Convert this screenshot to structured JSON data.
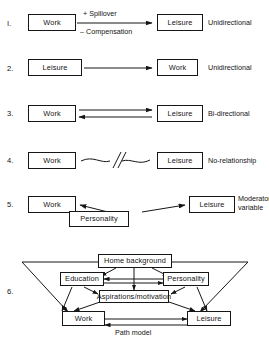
{
  "figure": {
    "background_color": "#ffffff",
    "line_color": "#161616"
  },
  "rows": [
    {
      "number": "I.",
      "left_box": "Work",
      "right_box": "Leisure",
      "label_above_arrow": "+ Spillover",
      "label_below_arrow": "– Compensation",
      "relationship": "Unidirectional",
      "arrow_type": "single-right"
    },
    {
      "number": "2.",
      "left_box": "Leisure",
      "right_box": "Work",
      "label_above_arrow": "",
      "label_below_arrow": "",
      "relationship": "Unidirectional",
      "arrow_type": "single-right"
    },
    {
      "number": "3.",
      "left_box": "Work",
      "right_box": "Leisure",
      "label_above_arrow": "",
      "label_below_arrow": "",
      "relationship": "Bi-directional",
      "arrow_type": "double"
    },
    {
      "number": "4.",
      "left_box": "Work",
      "right_box": "Leisure",
      "label_above_arrow": "",
      "label_below_arrow": "",
      "relationship": "No-relationship",
      "arrow_type": "broken-wavy"
    },
    {
      "number": "5.",
      "left_box": "Work",
      "right_box": "Leisure",
      "middle_box": "Personality",
      "relationship": "Moderator\nvariable",
      "arrow_type": "moderator"
    }
  ],
  "path_model": {
    "number": "6.",
    "caption": "Path model",
    "nodes": {
      "home_background": "Home background",
      "education": "Education",
      "personality": "Personality",
      "aspirations": "Aspirations/motivation",
      "work": "Work",
      "leisure": "Leisure"
    },
    "relationships": [
      "Home background → Education",
      "Home background → Personality",
      "Home background → Aspirations/motivation",
      "Home background → Work",
      "Home background → Leisure",
      "Education ↔ Personality",
      "Education → Aspirations/motivation",
      "Personality → Aspirations/motivation",
      "Education → Work",
      "Personality → Leisure",
      "Aspirations/motivation → Work",
      "Aspirations/motivation → Leisure",
      "Work ↔ Leisure"
    ]
  }
}
